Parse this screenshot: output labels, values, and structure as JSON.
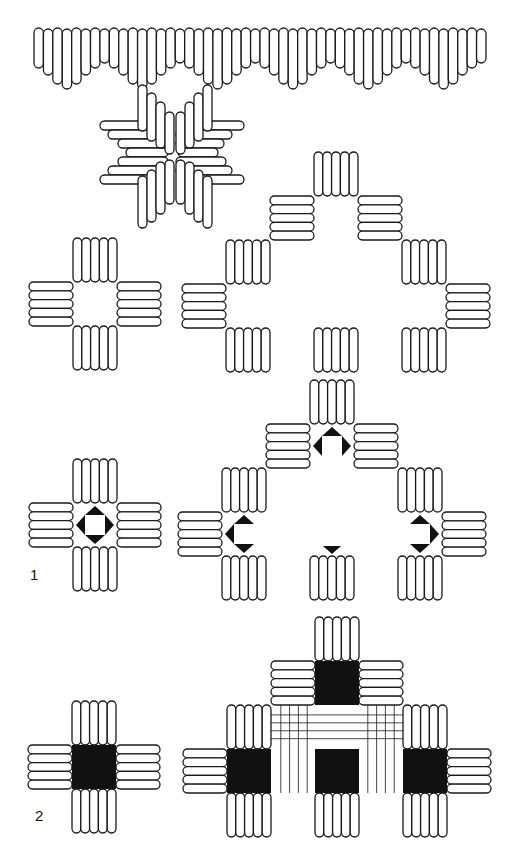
{
  "figure": {
    "type": "embroidery-stitch-pattern-diagram",
    "labels": [
      {
        "id": "fig1",
        "text": "1",
        "x": 30,
        "y": 574
      },
      {
        "id": "fig2",
        "text": "2",
        "x": 35,
        "y": 813
      }
    ],
    "colors": {
      "line": "#1a1a1a",
      "fill": "#111111",
      "background": "#ffffff"
    },
    "sections": [
      {
        "name": "fringe-border",
        "description": "Row of vertical satin stitches of varying length forming scalloped border"
      },
      {
        "name": "star-motif",
        "description": "Eight-pointed star of interlocking satin stitches"
      },
      {
        "name": "cross-plain",
        "description": "Cross of four kloster blocks with open center"
      },
      {
        "name": "stepped-plain",
        "description": "Stepped pyramid of kloster blocks"
      },
      {
        "name": "cross-triangles",
        "description": "Cross with four dark triangles in center (fig 1)"
      },
      {
        "name": "stepped-triangles",
        "description": "Stepped pyramid with dark triangle markers (fig 1)"
      },
      {
        "name": "cross-filled",
        "description": "Cross with solid filled center (fig 2)"
      },
      {
        "name": "stepped-filled",
        "description": "Stepped pyramid with filled squares and cut-thread grid (fig 2)"
      }
    ]
  }
}
